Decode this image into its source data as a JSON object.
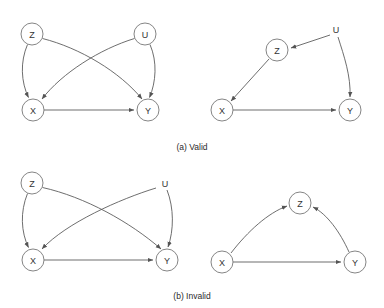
{
  "figure": {
    "background_color": "#ffffff",
    "node_stroke_color": "#777777",
    "node_fill_color": "#ffffff",
    "edge_color": "#545454",
    "text_color": "#333333",
    "caption_color": "#2b2b2b",
    "node_radius": 11
  },
  "panels": [
    {
      "id": "valid-left",
      "caption_group": "a",
      "nodes": [
        {
          "id": "z",
          "label": "Z",
          "x": 32,
          "y": 34,
          "circled": true
        },
        {
          "id": "u",
          "label": "U",
          "x": 145,
          "y": 34,
          "circled": true
        },
        {
          "id": "x",
          "label": "X",
          "x": 33,
          "y": 110,
          "circled": true
        },
        {
          "id": "y",
          "label": "Y",
          "x": 148,
          "y": 110,
          "circled": true
        }
      ],
      "edges": [
        {
          "from": "z",
          "to": "x",
          "name": "edge-z-to-x",
          "shape": "curve-left"
        },
        {
          "from": "z",
          "to": "y",
          "name": "edge-z-to-y",
          "shape": "cross-down-right"
        },
        {
          "from": "u",
          "to": "x",
          "name": "edge-u-to-x",
          "shape": "cross-down-left"
        },
        {
          "from": "u",
          "to": "y",
          "name": "edge-u-to-y",
          "shape": "curve-right"
        },
        {
          "from": "x",
          "to": "y",
          "name": "edge-x-to-y",
          "shape": "straight"
        }
      ]
    },
    {
      "id": "valid-right",
      "caption_group": "a",
      "nodes": [
        {
          "id": "u",
          "label": "U",
          "x": 336,
          "y": 30,
          "circled": false
        },
        {
          "id": "z",
          "label": "Z",
          "x": 277,
          "y": 50,
          "circled": true
        },
        {
          "id": "x",
          "label": "X",
          "x": 222,
          "y": 110,
          "circled": true
        },
        {
          "id": "y",
          "label": "Y",
          "x": 350,
          "y": 110,
          "circled": true
        }
      ],
      "edges": [
        {
          "from": "u",
          "to": "z",
          "name": "edge-u-to-z",
          "shape": "straight"
        },
        {
          "from": "z",
          "to": "x",
          "name": "edge-z-to-x",
          "shape": "straight"
        },
        {
          "from": "u",
          "to": "y",
          "name": "edge-u-to-y",
          "shape": "curve-right"
        },
        {
          "from": "x",
          "to": "y",
          "name": "edge-x-to-y",
          "shape": "straight"
        }
      ]
    },
    {
      "id": "invalid-left",
      "caption_group": "b",
      "nodes": [
        {
          "id": "z",
          "label": "Z",
          "x": 32,
          "y": 183,
          "circled": true
        },
        {
          "id": "u",
          "label": "U",
          "x": 165,
          "y": 184,
          "circled": false
        },
        {
          "id": "x",
          "label": "X",
          "x": 33,
          "y": 260,
          "circled": true
        },
        {
          "id": "y",
          "label": "Y",
          "x": 167,
          "y": 260,
          "circled": true
        }
      ],
      "edges": [
        {
          "from": "z",
          "to": "x",
          "name": "edge-z-to-x",
          "shape": "curve-left"
        },
        {
          "from": "z",
          "to": "y",
          "name": "edge-z-to-y",
          "shape": "cross-down-right"
        },
        {
          "from": "u",
          "to": "x",
          "name": "edge-u-to-x",
          "shape": "cross-down-left"
        },
        {
          "from": "u",
          "to": "y",
          "name": "edge-u-to-y",
          "shape": "curve-right"
        },
        {
          "from": "x",
          "to": "y",
          "name": "edge-x-to-y",
          "shape": "straight"
        }
      ]
    },
    {
      "id": "invalid-right",
      "caption_group": "b",
      "nodes": [
        {
          "id": "z",
          "label": "Z",
          "x": 300,
          "y": 203,
          "circled": true
        },
        {
          "id": "x",
          "label": "X",
          "x": 222,
          "y": 262,
          "circled": true
        },
        {
          "id": "y",
          "label": "Y",
          "x": 355,
          "y": 262,
          "circled": true
        }
      ],
      "edges": [
        {
          "from": "x",
          "to": "z",
          "name": "edge-x-to-z",
          "shape": "arc-up"
        },
        {
          "from": "y",
          "to": "z",
          "name": "edge-y-to-z",
          "shape": "arc-up"
        },
        {
          "from": "x",
          "to": "y",
          "name": "edge-x-to-y",
          "shape": "straight"
        }
      ]
    }
  ],
  "captions": [
    {
      "id": "caption-a",
      "text": "(a) Valid",
      "x": 192,
      "y": 147
    },
    {
      "id": "caption-b",
      "text": "(b) Invalid",
      "x": 192,
      "y": 296
    }
  ]
}
